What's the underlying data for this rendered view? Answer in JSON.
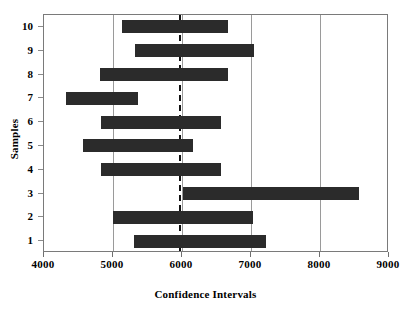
{
  "chart_data": {
    "type": "bar",
    "orientation": "horizontal",
    "title": "",
    "xlabel": "Confidence Intervals",
    "ylabel": "Samples",
    "xlim": [
      4000,
      9000
    ],
    "ylim": [
      0.5,
      10.5
    ],
    "xticks": [
      4000,
      5000,
      6000,
      7000,
      8000,
      9000
    ],
    "xtick_labels": [
      "4000",
      "5000",
      "6000",
      "7000",
      "8000",
      "9000"
    ],
    "yticks": [
      1,
      2,
      3,
      4,
      5,
      6,
      7,
      8,
      9,
      10
    ],
    "ytick_labels": [
      "1",
      "2",
      "3",
      "4",
      "5",
      "6",
      "7",
      "8",
      "9",
      "10"
    ],
    "grid": "vertical-only",
    "gridlines_x": [
      5000,
      6000,
      7000,
      8000
    ],
    "legend": null,
    "reference_line": {
      "x": 5950,
      "style": "dashed",
      "color": "#111111"
    },
    "bar_color": "#2b2b2b",
    "categories": [
      "1",
      "2",
      "3",
      "4",
      "5",
      "6",
      "7",
      "8",
      "9",
      "10"
    ],
    "intervals": [
      {
        "sample": "1",
        "lower": 5300,
        "upper": 7220
      },
      {
        "sample": "2",
        "lower": 5000,
        "upper": 7030
      },
      {
        "sample": "3",
        "lower": 6015,
        "upper": 8565
      },
      {
        "sample": "4",
        "lower": 4830,
        "upper": 6565
      },
      {
        "sample": "5",
        "lower": 4565,
        "upper": 6160
      },
      {
        "sample": "6",
        "lower": 4830,
        "upper": 6565
      },
      {
        "sample": "7",
        "lower": 4320,
        "upper": 5360
      },
      {
        "sample": "8",
        "lower": 4810,
        "upper": 6665
      },
      {
        "sample": "9",
        "lower": 5320,
        "upper": 7040
      },
      {
        "sample": "10",
        "lower": 5130,
        "upper": 6660
      }
    ]
  }
}
